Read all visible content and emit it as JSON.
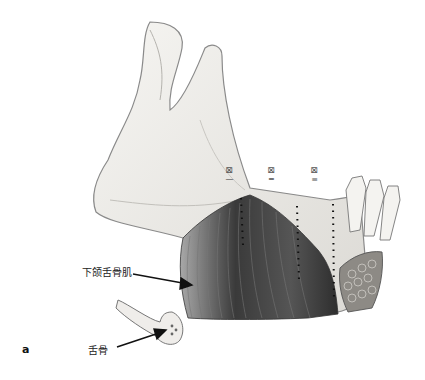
{
  "figure": {
    "panel_label": "a",
    "labels": {
      "muscle": "下颌舌骨肌",
      "bone": "舌骨"
    },
    "zones": [
      {
        "symbol": "⊠",
        "numeral": "—"
      },
      {
        "symbol": "⊠",
        "numeral": "═"
      },
      {
        "symbol": "⊠",
        "numeral": "≡"
      }
    ],
    "colors": {
      "bone_outline": "#8a8a8a",
      "bone_fill": "#f2f0ec",
      "muscle_dark": "#3a3a3a",
      "muscle_light": "#9a9a9a",
      "arrow": "#111111"
    }
  }
}
